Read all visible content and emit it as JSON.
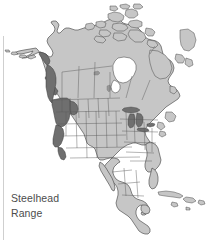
{
  "figure": {
    "title": "Steelhead Range",
    "type": "range-distribution-map",
    "region": "North America",
    "background_color": "#ffffff"
  },
  "legend": {
    "line1": "Steelhead",
    "line2": "Range",
    "text_color": "#4c4c4c"
  },
  "map": {
    "land_fill": "#c6c6c6",
    "land_stroke": "#3d3d3d",
    "border_stroke": "#555555",
    "range_fill": "#6f6f6f",
    "lakes_fill": "#6f6f6f",
    "water_fill": "#ffffff",
    "features": [
      "Alaska",
      "Aleutian Islands",
      "Canada",
      "Canadian Arctic Archipelago",
      "Hudson Bay",
      "Greenland edge",
      "United States",
      "Great Lakes",
      "Mexico",
      "Central America",
      "Cuba",
      "Hispaniola",
      "Puerto Rico",
      "Baja California",
      "Florida",
      "Newfoundland"
    ],
    "range_areas": [
      "Alaska panhandle coast",
      "British Columbia coast",
      "Vancouver Island",
      "Washington",
      "Oregon",
      "Idaho",
      "Northern California coast"
    ]
  }
}
